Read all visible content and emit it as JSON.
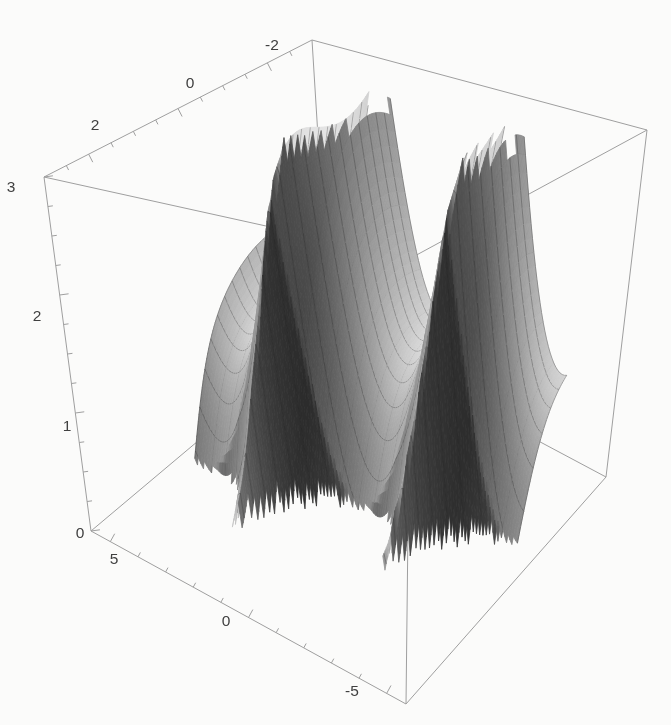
{
  "figure": {
    "kind": "3d-surface-plot-figure",
    "background": "#fbfbfa"
  },
  "chart_data": {
    "type": "surface3d",
    "title": "",
    "axes": {
      "x": {
        "range": [
          -3,
          3
        ],
        "major": [
          2,
          0,
          -2
        ],
        "minor_step": 0.5,
        "labels": [
          {
            "text": "2",
            "x": 95,
            "y": 126
          },
          {
            "text": "0",
            "x": 190,
            "y": 84
          },
          {
            "text": "-2",
            "x": 272,
            "y": 46
          }
        ]
      },
      "y": {
        "range": [
          -5.7,
          5.7
        ],
        "major": [
          5,
          0,
          -5
        ],
        "minor_step": 1,
        "labels": [
          {
            "text": "5",
            "x": 114,
            "y": 560
          },
          {
            "text": "0",
            "x": 226,
            "y": 622
          },
          {
            "text": "-5",
            "x": 352,
            "y": 692
          }
        ]
      },
      "z": {
        "range": [
          0,
          3
        ],
        "major": [
          0,
          1,
          2,
          3
        ],
        "minor_step": 0.25,
        "labels": [
          {
            "text": "0",
            "x": 80,
            "y": 534
          },
          {
            "text": "1",
            "x": 67,
            "y": 427
          },
          {
            "text": "2",
            "x": 37,
            "y": 317
          },
          {
            "text": "3",
            "x": 11,
            "y": 188
          }
        ]
      }
    },
    "surface": {
      "domain_x": [
        -2,
        2
      ],
      "domain_y": [
        -5,
        5
      ],
      "clip_z": [
        0,
        3
      ],
      "samples": 120,
      "mesh_every": 6,
      "model": {
        "tilt_coupling": 0.17,
        "front_amp": 2.75,
        "front_rate": 1.1,
        "back_amp": 1.15,
        "back_rate": 1.45,
        "wall_coef": 0.5,
        "valley_spacing": 4.5,
        "valley_offset": -0.1,
        "drift_amp": 0.3,
        "drift_freq": 1.15
      }
    },
    "projection": {
      "corners": {
        "c000": [
          91,
          531
        ],
        "c100": [
          330,
          330
        ],
        "c010": [
          406,
          704
        ],
        "c110": [
          606,
          477
        ],
        "c001": [
          44,
          177
        ],
        "c101": [
          312,
          40
        ],
        "c011": [
          411,
          258
        ],
        "c111": [
          647,
          130
        ]
      }
    },
    "style": {
      "background": "#fbfbfa",
      "axis_color": "#9f9f9f",
      "axis_width": 1,
      "label_color": "#404040",
      "label_font_px": 15.5,
      "tick_major_len": 9,
      "tick_minor_len": 5,
      "tick_dirs": {
        "x": [
          0.455,
          0.89
        ],
        "y": [
          0.482,
          -0.877
        ],
        "z": [
          0.991,
          -0.132
        ]
      },
      "mesh_color": "rgba(30,30,30,0.5)",
      "mesh_width": 0.55,
      "ambient": 0.15,
      "slope_scale": 0.42,
      "shade_max": 0.96,
      "lights": [
        {
          "dir": [
            0,
            0.778,
            0.628
          ],
          "w": 0.66
        },
        {
          "dir": [
            -0.63,
            -0.5,
            0.59
          ],
          "w": 0.5
        }
      ]
    }
  }
}
